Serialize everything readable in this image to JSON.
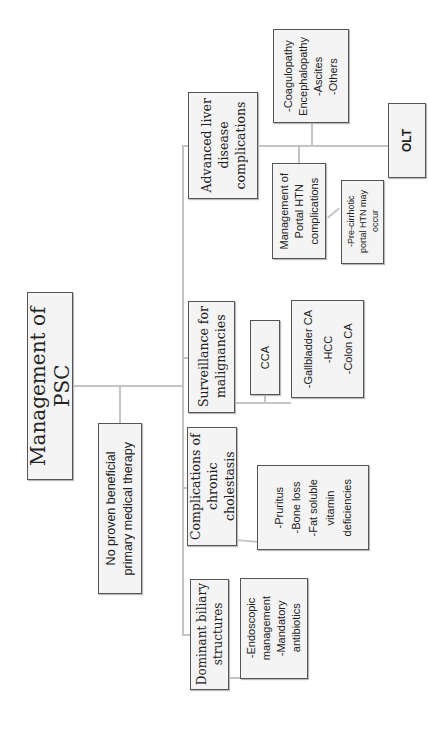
{
  "diagram": {
    "title": "Management of PSC",
    "nodes": {
      "root": {
        "label": "Management of PSC"
      },
      "no_therapy": {
        "label": "No proven beneficial\nprimary medical therapy"
      },
      "advanced_liver": {
        "label": "Advanced liver\ndisease\ncomplications"
      },
      "surveillance": {
        "label": "Surveillance for\nmalignancies"
      },
      "chronic_cholestasis": {
        "label": "Complications of\nchronic cholestasis"
      },
      "dominant_strictures": {
        "label": "Dominant biliary\nstructures"
      },
      "liver_list": {
        "label": "-Coagulopathy\nEncephalopathy\n-Ascites\n-Others"
      },
      "portal_htn": {
        "label": "Management of\nPortal HTN\ncomplications"
      },
      "pre_cirrhotic": {
        "label": "-Pre-cirrhotic\nportal HTN may\noccur"
      },
      "olt": {
        "label": "OLT"
      },
      "cca": {
        "label": "CCA"
      },
      "other_malignancies": {
        "label": "-Gallbladder CA\n-HCC\n-Colon CA"
      },
      "cholestasis_list": {
        "label": "-Pruritus\n-Bone loss\n-Fat soluble\nvitamin\ndeficiencies"
      },
      "strictures_list": {
        "label": "-Endoscopic\nmanagement\n-Mandatory\nantibiotics"
      }
    },
    "edges": [
      [
        "root",
        "no_therapy"
      ],
      [
        "root",
        "advanced_liver"
      ],
      [
        "root",
        "surveillance"
      ],
      [
        "root",
        "chronic_cholestasis"
      ],
      [
        "root",
        "dominant_strictures"
      ],
      [
        "advanced_liver",
        "liver_list"
      ],
      [
        "advanced_liver",
        "portal_htn"
      ],
      [
        "advanced_liver",
        "olt"
      ],
      [
        "portal_htn",
        "pre_cirrhotic"
      ],
      [
        "surveillance",
        "cca"
      ],
      [
        "surveillance",
        "other_malignancies"
      ],
      [
        "chronic_cholestasis",
        "cholestasis_list"
      ],
      [
        "dominant_strictures",
        "strictures_list"
      ]
    ],
    "colors": {
      "box_fill": "#f4f4f4",
      "box_border": "#555555",
      "connector": "#c4c4c4"
    }
  }
}
